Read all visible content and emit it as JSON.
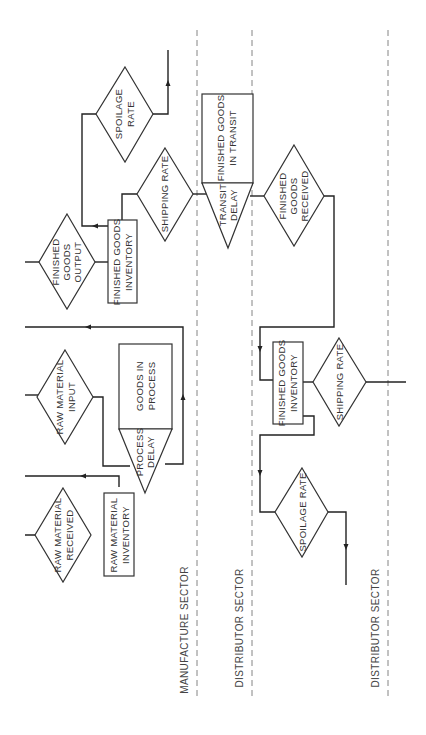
{
  "diagram": {
    "orientation": "rotated-90-ccw",
    "sectors": [
      {
        "id": "manufacture",
        "label": "MANUFACTURE SECTOR"
      },
      {
        "id": "distributor1",
        "label": "DISTRIBUTOR SECTOR"
      },
      {
        "id": "distributor2",
        "label": "DISTRIBUTOR SECTOR"
      }
    ],
    "nodes": {
      "raw_material_received": {
        "type": "rate",
        "lines": [
          "RAW MATERIAL",
          "RECEIVED"
        ]
      },
      "raw_material_inventory": {
        "type": "level",
        "lines": [
          "RAW MATERIAL",
          "INVENTORY"
        ]
      },
      "raw_material_input": {
        "type": "rate",
        "lines": [
          "RAW MATERIAL",
          "INPUT"
        ]
      },
      "goods_in_process": {
        "type": "level",
        "lines": [
          "GOODS IN",
          "PROCESS"
        ]
      },
      "process_delay": {
        "type": "delay",
        "lines": [
          "PROCESS",
          "DELAY"
        ]
      },
      "finished_goods_output": {
        "type": "rate",
        "lines": [
          "FINISHED",
          "GOODS",
          "OUTPUT"
        ]
      },
      "mfg_finished_goods_inventory": {
        "type": "level",
        "lines": [
          "FINISHED GOODS",
          "INVENTORY"
        ]
      },
      "mfg_shipping_rate": {
        "type": "rate",
        "lines": [
          "SHIPPING RATE"
        ]
      },
      "mfg_spoilage_rate": {
        "type": "rate",
        "lines": [
          "SPOILAGE",
          "RATE"
        ]
      },
      "finished_goods_in_transit": {
        "type": "level",
        "lines": [
          "FINISHED GOODS",
          "IN TRANSIT"
        ]
      },
      "transit_delay": {
        "type": "delay",
        "lines": [
          "TRANSIT",
          "DELAY"
        ]
      },
      "finished_goods_received": {
        "type": "rate",
        "lines": [
          "FINISHED",
          "GOODS",
          "RECEIVED"
        ]
      },
      "dist_finished_goods_inventory": {
        "type": "level",
        "lines": [
          "FINISHED GOODS",
          "INVENTORY"
        ]
      },
      "dist_shipping_rate": {
        "type": "rate",
        "lines": [
          "SHIPPING RATE"
        ]
      },
      "dist_spoilage_rate": {
        "type": "rate",
        "lines": [
          "SPOILAGE RATE"
        ]
      }
    },
    "colors": {
      "line": "#222222",
      "shape_stroke": "#333333",
      "divider": "#777777",
      "text": "#333333"
    }
  }
}
